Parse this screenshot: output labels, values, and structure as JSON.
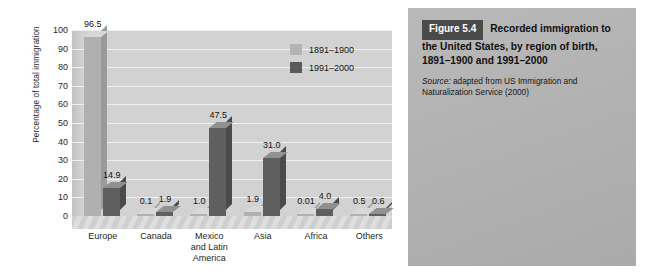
{
  "chart_data": {
    "type": "bar",
    "title": "",
    "xlabel": "",
    "ylabel": "Percentage of total immigration",
    "ylim": [
      0,
      100
    ],
    "yticks": [
      100,
      90,
      80,
      70,
      60,
      50,
      40,
      30,
      20,
      10,
      0
    ],
    "grid": true,
    "legend_position": "inside-top-right",
    "categories": [
      "Europe",
      "Canada",
      "Mexico\nand Latin\nAmerica",
      "Asia",
      "Africa",
      "Others"
    ],
    "category_labels": [
      [
        "Europe"
      ],
      [
        "Canada"
      ],
      [
        "Mexico",
        "and Latin",
        "America"
      ],
      [
        "Asia"
      ],
      [
        "Africa"
      ],
      [
        "Others"
      ]
    ],
    "series": [
      {
        "name": "1891–1900",
        "color": "#b0b0b0",
        "values": [
          96.5,
          0.1,
          1.0,
          1.9,
          0.01,
          0.5
        ],
        "labels": [
          "96.5",
          "0.1",
          "1.0",
          "1.9",
          "0.01",
          "0.5"
        ]
      },
      {
        "name": "1991–2000",
        "color": "#5f5f5f",
        "values": [
          14.9,
          1.9,
          47.5,
          31.0,
          4.0,
          0.6
        ],
        "labels": [
          "14.9",
          "1.9",
          "47.5",
          "31.0",
          "4.0",
          "0.6"
        ]
      }
    ]
  },
  "chart": {
    "y_axis_title": "Percentage of total immigration",
    "legend": [
      {
        "label": "1891–1900"
      },
      {
        "label": "1991–2000"
      }
    ]
  },
  "caption": {
    "figure_number": "Figure 5.4",
    "title": "Recorded immigration to the United States, by region of birth, 1891–1900 and 1991–2000",
    "source_word": "Source:",
    "source_text": " adapted from US Immigration and Naturalization Service (2000)"
  },
  "colors": {
    "series1": "#b0b0b0",
    "series2": "#5f5f5f",
    "panel_bg": "#b2b2b2",
    "badge_bg": "#4a4a4a",
    "plot_bg": "#d2d2d2"
  }
}
